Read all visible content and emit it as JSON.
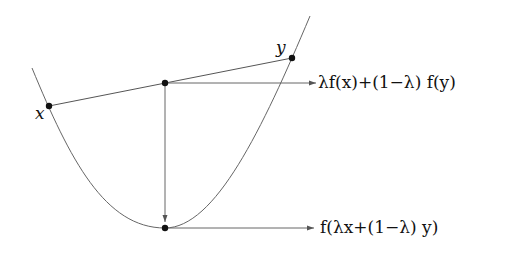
{
  "diagram": {
    "colors": {
      "line": "#555555",
      "point": "#111111",
      "text": "#111111",
      "background": "#ffffff"
    },
    "points": {
      "x": {
        "label": "x",
        "cx": 49,
        "cy": 106
      },
      "y": {
        "label": "y",
        "cx": 292,
        "cy": 58
      },
      "chord_point": {
        "cx": 165,
        "cy": 83
      },
      "curve_point": {
        "cx": 165,
        "cy": 228
      }
    },
    "labels": {
      "x_label": "x",
      "y_label": "y",
      "upper_formula": "λf(x)+(1−λ) f(y)",
      "lower_formula": "f(λx+(1−λ) y)"
    },
    "arrows": [
      {
        "name": "chord-to-label",
        "from": [
          165,
          83
        ],
        "to": [
          316,
          83
        ]
      },
      {
        "name": "chord-to-curve",
        "from": [
          165,
          83
        ],
        "to": [
          165,
          222
        ]
      },
      {
        "name": "curve-to-label",
        "from": [
          165,
          228
        ],
        "to": [
          314,
          228
        ]
      }
    ]
  }
}
